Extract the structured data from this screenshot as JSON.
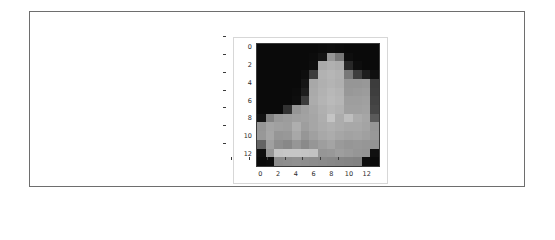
{
  "figure": {
    "background_color": "#ffffff",
    "panel_border_color": "#d7d7d7",
    "axes_border_color": "#3a3a3a",
    "outer_frame_color": "#6e6e6e",
    "tick_label_color": "#2b2b2b"
  },
  "axis": {
    "x_ticks": [
      "0",
      "2",
      "4",
      "6",
      "8",
      "10",
      "12"
    ],
    "y_ticks": [
      "0",
      "2",
      "4",
      "6",
      "8",
      "10",
      "12"
    ]
  },
  "chart_data": {
    "type": "heatmap",
    "title": "",
    "xlabel": "",
    "ylabel": "",
    "colormap": "gray",
    "vmin": 0,
    "vmax": 255,
    "grid": false,
    "legend": "none",
    "xlim": [
      -0.5,
      13.5
    ],
    "ylim": [
      13.5,
      -0.5
    ],
    "x": [
      0,
      1,
      2,
      3,
      4,
      5,
      6,
      7,
      8,
      9,
      10,
      11,
      12,
      13
    ],
    "y": [
      0,
      1,
      2,
      3,
      4,
      5,
      6,
      7,
      8,
      9,
      10,
      11,
      12,
      13
    ],
    "xtick_labels": [
      "0",
      "2",
      "4",
      "6",
      "8",
      "10",
      "12"
    ],
    "ytick_labels": [
      "0",
      "2",
      "4",
      "6",
      "8",
      "10",
      "12"
    ],
    "values": [
      [
        10,
        10,
        10,
        10,
        10,
        10,
        10,
        12,
        14,
        12,
        10,
        10,
        10,
        10
      ],
      [
        10,
        10,
        10,
        10,
        10,
        10,
        12,
        20,
        150,
        120,
        14,
        10,
        10,
        10
      ],
      [
        10,
        10,
        10,
        10,
        10,
        10,
        14,
        170,
        176,
        172,
        40,
        14,
        10,
        10
      ],
      [
        10,
        10,
        10,
        10,
        10,
        14,
        60,
        178,
        182,
        178,
        120,
        62,
        30,
        16
      ],
      [
        10,
        10,
        10,
        10,
        10,
        22,
        168,
        176,
        180,
        176,
        150,
        150,
        152,
        60
      ],
      [
        10,
        10,
        10,
        10,
        12,
        30,
        170,
        178,
        184,
        180,
        152,
        154,
        156,
        62
      ],
      [
        10,
        10,
        10,
        10,
        14,
        60,
        172,
        180,
        186,
        182,
        158,
        158,
        160,
        66
      ],
      [
        10,
        10,
        10,
        50,
        150,
        160,
        168,
        176,
        182,
        178,
        160,
        160,
        162,
        70
      ],
      [
        18,
        130,
        152,
        156,
        160,
        162,
        166,
        174,
        196,
        172,
        190,
        172,
        166,
        90
      ],
      [
        150,
        164,
        160,
        158,
        174,
        158,
        166,
        172,
        176,
        172,
        168,
        168,
        164,
        150
      ],
      [
        152,
        166,
        150,
        152,
        168,
        150,
        160,
        168,
        172,
        166,
        162,
        164,
        160,
        152
      ],
      [
        100,
        160,
        142,
        136,
        150,
        138,
        150,
        158,
        164,
        154,
        150,
        152,
        150,
        148
      ],
      [
        14,
        150,
        196,
        198,
        198,
        196,
        194,
        150,
        152,
        158,
        154,
        150,
        148,
        16
      ],
      [
        10,
        12,
        140,
        142,
        144,
        142,
        140,
        138,
        136,
        134,
        132,
        130,
        14,
        10
      ]
    ]
  }
}
